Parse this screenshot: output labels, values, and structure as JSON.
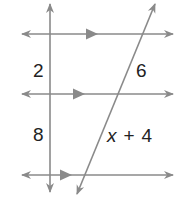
{
  "figure": {
    "type": "parallel-lines-with-transversals",
    "line_color": "#8a8a8a",
    "text_color": "#222222",
    "parallel_lines_count": 3,
    "transversals_count": 2
  },
  "labels": {
    "left_upper_segment": "2",
    "left_lower_segment": "8",
    "right_upper_segment": "6",
    "right_lower_var": "x",
    "right_lower_op": "+",
    "right_lower_const": "4"
  }
}
